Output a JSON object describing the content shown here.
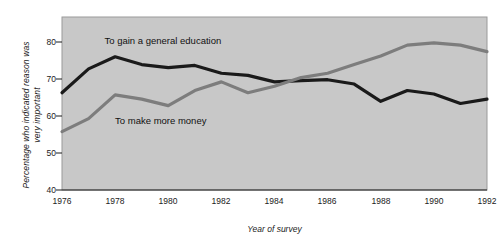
{
  "chart_data": {
    "type": "line",
    "title": "",
    "xlabel": "Year of survey",
    "ylabel": "Percentage who indicated reason was very important",
    "ylabel_line1": "Percentage who indicated reason was",
    "ylabel_line2": "very important",
    "xlim": [
      1976,
      1992
    ],
    "ylim": [
      40,
      80
    ],
    "yticks": [
      40,
      50,
      60,
      70,
      80
    ],
    "xticks": [
      1976,
      1978,
      1980,
      1982,
      1984,
      1986,
      1988,
      1990,
      1992
    ],
    "grid": false,
    "legend_position": "inline-annotations",
    "plot_background": "#c8c8c8",
    "x": [
      1976,
      1977,
      1978,
      1979,
      1980,
      1981,
      1982,
      1983,
      1984,
      1985,
      1986,
      1987,
      1988,
      1989,
      1990,
      1991,
      1992
    ],
    "series": [
      {
        "name": "To gain a general education",
        "color": "#1a1a1a",
        "values": [
          62.5,
          68.0,
          70.8,
          69.0,
          68.3,
          68.8,
          67.0,
          66.5,
          65.0,
          65.3,
          65.5,
          64.5,
          60.5,
          63.0,
          62.2,
          60.0,
          61.0
        ]
      },
      {
        "name": "To make more money",
        "color": "#7d7d7d",
        "values": [
          53.5,
          56.5,
          62.0,
          61.0,
          59.5,
          63.0,
          65.0,
          62.5,
          64.0,
          66.0,
          67.0,
          69.0,
          71.0,
          73.5,
          74.0,
          73.5,
          72.0
        ]
      }
    ],
    "annotations": [
      {
        "text": "To gain a general education",
        "series": "To gain a general education",
        "x": 1977.6,
        "y": 74.5
      },
      {
        "text": "To make more money",
        "series": "To make more money",
        "x": 1978.0,
        "y": 56.0
      }
    ]
  }
}
